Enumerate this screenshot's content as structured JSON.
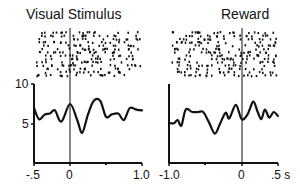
{
  "chart_data": [
    {
      "type": "line",
      "panel": "left",
      "title": "Visual Stimulus",
      "xlabel": "",
      "ylabel": "",
      "xlim": [
        -0.5,
        1.0
      ],
      "ylim": [
        0,
        10
      ],
      "x_tick_labels": [
        "-.5",
        "0",
        "1.0"
      ],
      "x_minor_ticks": [
        0.5
      ],
      "y_tick_labels": [
        "10",
        "5"
      ],
      "grid": false,
      "event_line_x": 0,
      "raster": true,
      "series": [
        {
          "name": "firing rate",
          "x": [
            -0.5,
            -0.43,
            -0.35,
            -0.28,
            -0.21,
            -0.12,
            0.0,
            0.1,
            0.17,
            0.25,
            0.33,
            0.42,
            0.5,
            0.58,
            0.67,
            0.75,
            0.83,
            0.92,
            1.0
          ],
          "y": [
            7.0,
            5.6,
            6.2,
            6.3,
            6.7,
            5.3,
            7.5,
            5.5,
            3.9,
            6.2,
            7.9,
            7.9,
            5.9,
            6.2,
            6.3,
            5.5,
            7.0,
            6.8,
            6.7
          ]
        }
      ]
    },
    {
      "type": "line",
      "panel": "right",
      "title": "Reward",
      "xlabel": "s",
      "ylabel": "",
      "xlim": [
        -1.0,
        0.5
      ],
      "ylim": [
        0,
        10
      ],
      "x_tick_labels": [
        "-1.0",
        "0",
        ".5 s"
      ],
      "x_minor_ticks": [
        -0.5
      ],
      "grid": false,
      "event_line_x": 0,
      "raster": true,
      "series": [
        {
          "name": "firing rate",
          "x": [
            -1.0,
            -0.93,
            -0.88,
            -0.83,
            -0.77,
            -0.68,
            -0.6,
            -0.53,
            -0.45,
            -0.37,
            -0.3,
            -0.22,
            -0.17,
            -0.08,
            0.0,
            0.08,
            0.16,
            0.22,
            0.27,
            0.32,
            0.38,
            0.44,
            0.5
          ],
          "y": [
            5.1,
            5.1,
            5.5,
            4.8,
            6.8,
            6.5,
            6.5,
            6.5,
            5.2,
            3.8,
            5.0,
            6.4,
            5.7,
            7.4,
            5.6,
            6.2,
            7.8,
            6.5,
            5.6,
            6.8,
            5.8,
            6.5,
            6.0
          ]
        }
      ]
    }
  ],
  "labels": {
    "left_title": "Visual Stimulus",
    "right_title": "Reward",
    "y_ticks": [
      "10",
      "5"
    ],
    "left_x_ticks": [
      "-.5",
      "0",
      "1.0"
    ],
    "right_x_ticks": [
      "-1.0",
      "0",
      ".5 s"
    ]
  }
}
